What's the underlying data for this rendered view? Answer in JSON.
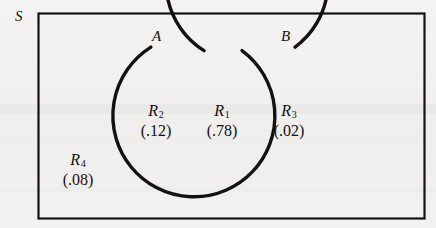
{
  "figure": {
    "type": "venn-diagram",
    "universe_label": "S",
    "sets": [
      {
        "id": "A",
        "label": "A"
      },
      {
        "id": "B",
        "label": "B"
      }
    ],
    "regions": [
      {
        "id": "R2",
        "name": "R",
        "subscript": "2",
        "value": "(.12)",
        "meaning": "A only"
      },
      {
        "id": "R1",
        "name": "R",
        "subscript": "1",
        "value": "(.78)",
        "meaning": "A and B"
      },
      {
        "id": "R3",
        "name": "R",
        "subscript": "3",
        "value": "(.02)",
        "meaning": "B only"
      },
      {
        "id": "R4",
        "name": "R",
        "subscript": "4",
        "value": "(.08)",
        "meaning": "outside A and B"
      }
    ],
    "colors": {
      "ink": "#111111",
      "paper": "#f2f1ef"
    }
  }
}
